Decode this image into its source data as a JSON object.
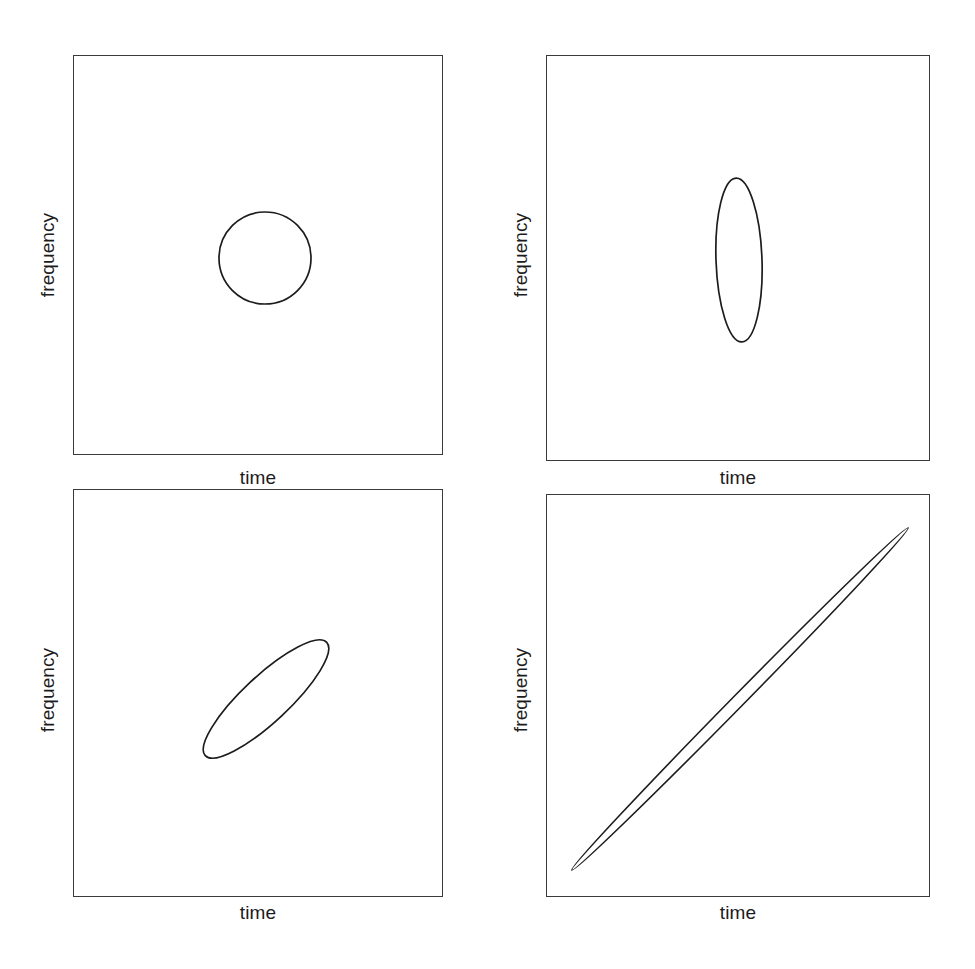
{
  "figure": {
    "width": 975,
    "height": 969,
    "background_color": "#ffffff",
    "line_color": "#1c1c1c",
    "frame_color": "#3a3a3a",
    "panel_count": 4,
    "layout": "2x2 grid"
  },
  "labels": {
    "x_axis": "time",
    "y_axis": "frequency"
  },
  "panels": [
    {
      "id": "panel-top-left",
      "position": "top-left",
      "xlabel": "time",
      "ylabel": "frequency",
      "box": {
        "x": 73,
        "y": 55,
        "width": 370,
        "height": 400
      },
      "shape": {
        "type": "ellipse",
        "name": "circle",
        "cx": 265,
        "cy": 258,
        "rx": 46,
        "ry": 46,
        "rotation_deg": 0,
        "aspect_ratio": 1.0
      },
      "xlabel_pos": {
        "x": 258,
        "y": 478
      },
      "ylabel_pos": {
        "x": 48,
        "y": 255
      }
    },
    {
      "id": "panel-top-right",
      "position": "top-right",
      "xlabel": "time",
      "ylabel": "frequency",
      "box": {
        "x": 546,
        "y": 55,
        "width": 384,
        "height": 406
      },
      "shape": {
        "type": "ellipse",
        "name": "vertical-ellipse",
        "cx": 739,
        "cy": 260,
        "rx": 23,
        "ry": 82,
        "rotation_deg": -2,
        "aspect_ratio": 0.28
      },
      "xlabel_pos": {
        "x": 738,
        "y": 478
      },
      "ylabel_pos": {
        "x": 521,
        "y": 255
      }
    },
    {
      "id": "panel-bottom-left",
      "position": "bottom-left",
      "xlabel": "time",
      "ylabel": "frequency",
      "box": {
        "x": 73,
        "y": 489,
        "width": 370,
        "height": 408
      },
      "shape": {
        "type": "ellipse",
        "name": "tilted-ellipse",
        "cx": 266,
        "cy": 699,
        "rx": 83,
        "ry": 23,
        "rotation_deg": -43,
        "aspect_ratio": 0.28
      },
      "xlabel_pos": {
        "x": 258,
        "y": 913
      },
      "ylabel_pos": {
        "x": 48,
        "y": 690
      }
    },
    {
      "id": "panel-bottom-right",
      "position": "bottom-right",
      "xlabel": "time",
      "ylabel": "frequency",
      "box": {
        "x": 546,
        "y": 494,
        "width": 384,
        "height": 403
      },
      "shape": {
        "type": "ellipse",
        "name": "extreme-tilted-ellipse",
        "cx": 740,
        "cy": 699,
        "rx": 240,
        "ry": 6,
        "rotation_deg": -45.5,
        "aspect_ratio": 0.025
      },
      "xlabel_pos": {
        "x": 738,
        "y": 913
      },
      "ylabel_pos": {
        "x": 521,
        "y": 690
      }
    }
  ],
  "chart_data": {
    "type": "scatter",
    "title": "",
    "xlabel": "time",
    "ylabel": "frequency",
    "subtitle": "",
    "grid": false,
    "legend": "none",
    "axis_ticks": "none",
    "series": [
      {
        "name": "circle",
        "panel": "top-left",
        "shape": "ellipse",
        "center": [
          0.5,
          0.5
        ],
        "semi_major": 0.125,
        "semi_minor": 0.125,
        "rotation_deg": 0,
        "eccentricity": 0.0
      },
      {
        "name": "vertical-ellipse",
        "panel": "top-right",
        "shape": "ellipse",
        "center": [
          0.5,
          0.5
        ],
        "semi_major": 0.205,
        "semi_minor": 0.06,
        "rotation_deg": -2,
        "eccentricity": 0.96
      },
      {
        "name": "tilted-ellipse",
        "panel": "bottom-left",
        "shape": "ellipse",
        "center": [
          0.52,
          0.51
        ],
        "semi_major": 0.21,
        "semi_minor": 0.06,
        "rotation_deg": -43,
        "eccentricity": 0.96
      },
      {
        "name": "extreme-tilted-ellipse",
        "panel": "bottom-right",
        "shape": "ellipse",
        "center": [
          0.5,
          0.5
        ],
        "semi_major": 0.62,
        "semi_minor": 0.016,
        "rotation_deg": -45.5,
        "eccentricity": 0.9997
      }
    ]
  }
}
